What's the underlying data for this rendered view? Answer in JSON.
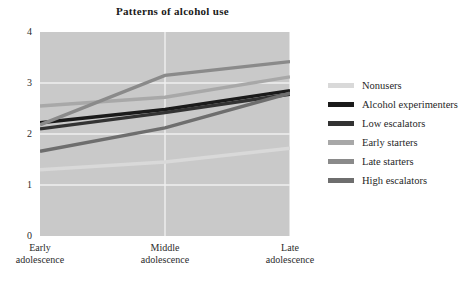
{
  "chart_data": {
    "type": "line",
    "title": "Patterns of alcohol use",
    "xlabel": "",
    "ylabel": "",
    "categories": [
      "Early adolescence",
      "Middle adolescence",
      "Late adolescence"
    ],
    "ylim": [
      0,
      4
    ],
    "yticks": [
      "0",
      "1",
      "2",
      "3",
      "4"
    ],
    "grid": true,
    "legend_position": "right",
    "series": [
      {
        "name": "Nonusers",
        "values": [
          1.3,
          1.45,
          1.72
        ],
        "color": "#d9d9d9"
      },
      {
        "name": "Alcohol experimenters",
        "values": [
          2.22,
          2.48,
          2.85
        ],
        "color": "#1a1a1a"
      },
      {
        "name": "Low escalators",
        "values": [
          2.1,
          2.42,
          2.78
        ],
        "color": "#333333"
      },
      {
        "name": "Early starters",
        "values": [
          2.55,
          2.72,
          3.12
        ],
        "color": "#a8a8a8"
      },
      {
        "name": "Late starters",
        "values": [
          2.18,
          3.15,
          3.42
        ],
        "color": "#8a8a8a"
      },
      {
        "name": "High escalators",
        "values": [
          1.66,
          2.12,
          2.8
        ],
        "color": "#6e6e6e"
      }
    ]
  }
}
